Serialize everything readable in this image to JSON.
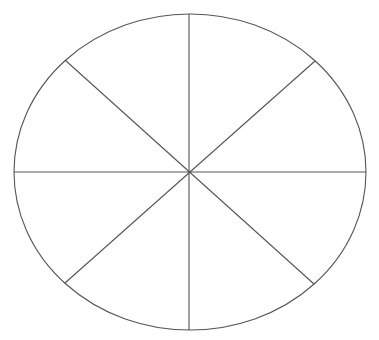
{
  "page": {
    "type": "scanned-worksheet",
    "background_color": "#ffffff",
    "line_color": "#555555"
  },
  "heading": {
    "text": "",
    "state": "clipped-illegible"
  },
  "figure": {
    "kind": "divided-circle",
    "sections": 8,
    "divider_angles_deg": [
      0,
      45,
      90,
      135,
      180,
      225,
      270,
      315
    ],
    "labels": []
  }
}
